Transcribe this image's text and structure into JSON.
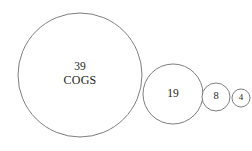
{
  "chart_data": {
    "type": "bubble",
    "title": "",
    "subtitle": "",
    "xlabel": "",
    "ylabel": "",
    "grid": false,
    "legend": "none",
    "axis_visible": false,
    "background_color": "#ffffff",
    "stroke_color": "#6f6f74",
    "text_color": "#1e1e22",
    "scaling": "radius proportional to value",
    "arrangement": "horizontally tangent circles, descending left to right",
    "categories": [
      "COGS",
      "",
      "",
      ""
    ],
    "values": [
      39,
      19,
      8,
      4
    ],
    "points": [
      {
        "value": 39,
        "value_label": "39",
        "name_label": "COGS",
        "cx": 80,
        "cy": 75,
        "r": 62
      },
      {
        "value": 19,
        "value_label": "19",
        "name_label": "",
        "cx": 173,
        "cy": 94,
        "r": 30
      },
      {
        "value": 8,
        "value_label": "8",
        "name_label": "",
        "cx": 216,
        "cy": 97,
        "r": 14
      },
      {
        "value": 4,
        "value_label": "4",
        "name_label": "",
        "cx": 241,
        "cy": 98,
        "r": 9
      }
    ]
  }
}
